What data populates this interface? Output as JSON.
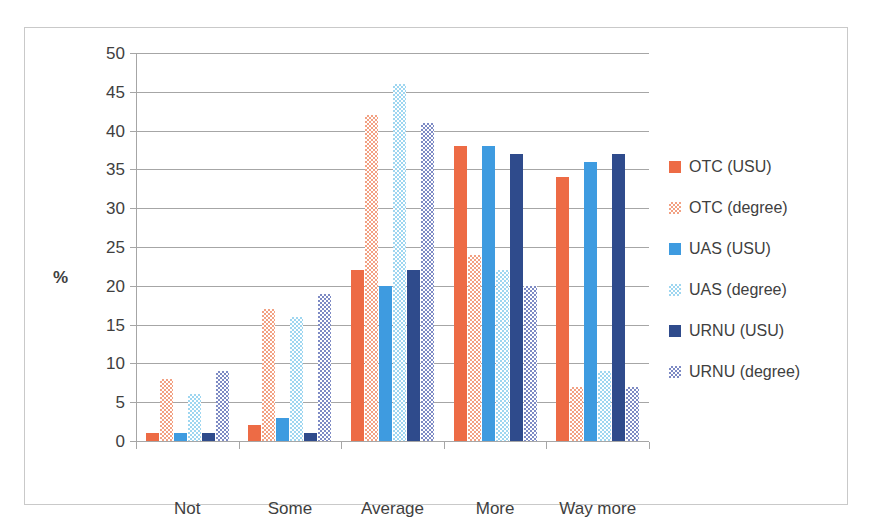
{
  "chart_data": {
    "type": "bar",
    "title": "",
    "xlabel": "",
    "ylabel": "%",
    "ylim": [
      0,
      50
    ],
    "ytick_step": 5,
    "yticks": [
      50,
      45,
      40,
      35,
      30,
      25,
      20,
      15,
      10,
      5,
      0
    ],
    "grid": true,
    "legend_position": "right",
    "categories": [
      "Not",
      "Some",
      "Average",
      "More",
      "Way more"
    ],
    "series": [
      {
        "name": "OTC (USU)",
        "values": [
          1,
          2,
          22,
          38,
          34
        ],
        "color": "#ED6B45",
        "fill": "solid"
      },
      {
        "name": "OTC (degree)",
        "values": [
          8,
          17,
          42,
          24,
          7
        ],
        "color": "#F2A183",
        "fill": "checker"
      },
      {
        "name": "UAS (USU)",
        "values": [
          1,
          3,
          20,
          38,
          36
        ],
        "color": "#3E9BE0",
        "fill": "solid"
      },
      {
        "name": "UAS (degree)",
        "values": [
          6,
          16,
          46,
          22,
          9
        ],
        "color": "#9ED6F0",
        "fill": "checker"
      },
      {
        "name": "URNU (USU)",
        "values": [
          1,
          1,
          22,
          37,
          37
        ],
        "color": "#2F4B8C",
        "fill": "solid"
      },
      {
        "name": "URNU (degree)",
        "values": [
          9,
          19,
          41,
          20,
          7
        ],
        "color": "#7D8AC4",
        "fill": "checker"
      }
    ]
  },
  "frame": {
    "border_color": "#c9c9c9",
    "background": "#ffffff",
    "gridline_color": "#a6a6a6",
    "text_color": "#404040"
  }
}
